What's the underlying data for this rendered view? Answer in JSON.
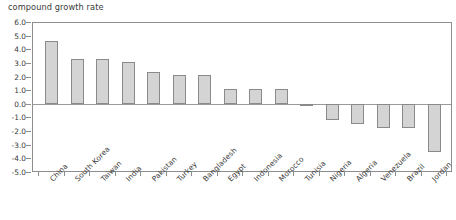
{
  "chart_data": {
    "type": "bar",
    "title": "compound growth rate",
    "xlabel": "",
    "ylabel": "",
    "ylim": [
      -5.0,
      6.0
    ],
    "ytick_step": 1.0,
    "grid": false,
    "legend": null,
    "zero_line": true,
    "bar_color": "#d4d4d4",
    "bar_border_color": "#8a8a8a",
    "axis_color": "#8d8d8d",
    "text_color": "#3a3a3a",
    "ytick_labels": [
      "6.0",
      "5.0",
      "4.0",
      "3.0",
      "2.0",
      "1.0",
      "0.0",
      "-1.0",
      "-2.0",
      "-3.0",
      "-4.0",
      "-5.0"
    ],
    "ytick_values": [
      6.0,
      5.0,
      4.0,
      3.0,
      2.0,
      1.0,
      0.0,
      -1.0,
      -2.0,
      -3.0,
      -4.0,
      -5.0
    ],
    "categories": [
      "China",
      "South Korea",
      "Taiwan",
      "India",
      "Pakistan",
      "Turkey",
      "Bangladesh",
      "Egypt",
      "Indonesia",
      "Morocco",
      "Tunisia",
      "Nigeria",
      "Algeria",
      "Venezuela",
      "Brazil",
      "Jordan"
    ],
    "values": [
      4.6,
      3.3,
      3.3,
      3.1,
      2.3,
      2.1,
      2.1,
      1.1,
      1.1,
      1.1,
      -0.15,
      -1.2,
      -1.5,
      -1.8,
      -1.8,
      -3.5
    ]
  }
}
